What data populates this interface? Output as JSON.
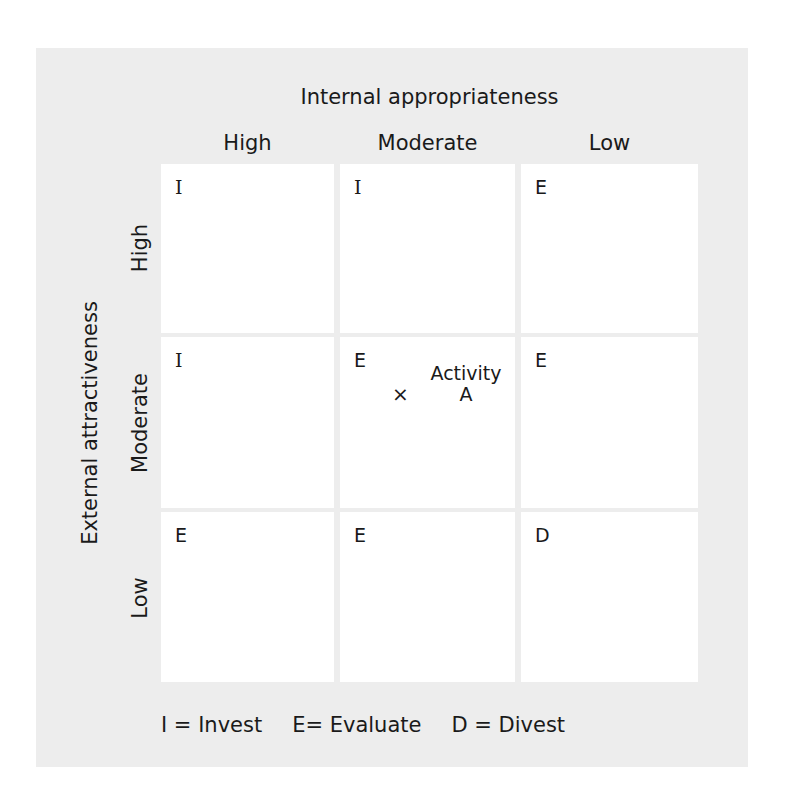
{
  "diagram": {
    "title_top": "Internal appropriateness",
    "title_left": "External attractiveness",
    "columns": [
      "High",
      "Moderate",
      "Low"
    ],
    "rows": [
      "High",
      "Moderate",
      "Low"
    ],
    "cells": [
      [
        "I",
        "I",
        "E"
      ],
      [
        "I",
        "E",
        "E"
      ],
      [
        "E",
        "E",
        "D"
      ]
    ],
    "marker": {
      "symbol": "×",
      "label_line1": "Activity",
      "label_line2": "A",
      "row": "Moderate",
      "column": "Moderate"
    },
    "legend": [
      "I = Invest",
      "E= Evaluate",
      "D = Divest"
    ]
  },
  "colors": {
    "panel_background": "#ededed",
    "cell_background": "#ffffff",
    "text": "#1a1a1a"
  }
}
